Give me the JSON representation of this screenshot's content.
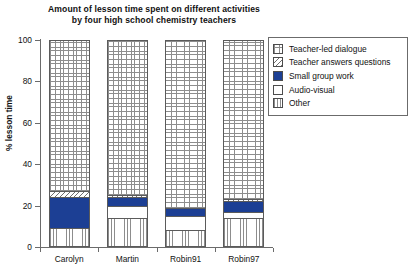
{
  "chart_data": {
    "type": "bar",
    "subtype": "stacked-bar-100",
    "title": "Amount of lesson time spent on different activities by four high school chemistry teachers",
    "title_line1": "Amount of lesson time spent on different activities",
    "title_line2": "by four high school chemistry teachers",
    "xlabel": "",
    "ylabel": "% lesson time",
    "ylim": [
      0,
      100
    ],
    "yticks": [
      0,
      20,
      40,
      60,
      80,
      100
    ],
    "ytick_labels": [
      "0",
      "20",
      "40",
      "60",
      "80",
      "100"
    ],
    "grid": false,
    "legend_position": "right",
    "categories": [
      "Carolyn",
      "Martin",
      "Robin91",
      "Robin97"
    ],
    "series": [
      {
        "name": "Teacher-led dialogue",
        "pattern": "crosshatch-grid",
        "color": "#8d8d8d",
        "values": [
          73,
          75,
          81,
          77
        ]
      },
      {
        "name": "Teacher answers questions",
        "pattern": "diagonal-hatch",
        "color": "#6f6f6f",
        "values": [
          3,
          1,
          0,
          1
        ]
      },
      {
        "name": "Small group work",
        "pattern": "solid",
        "color": "#1c3f94",
        "values": [
          15,
          4,
          4,
          5
        ]
      },
      {
        "name": "Audio-visual",
        "pattern": "white",
        "color": "#ffffff",
        "values": [
          0,
          6,
          7,
          3
        ]
      },
      {
        "name": "Other",
        "pattern": "vertical-lines",
        "color": "#8d8d8d",
        "values": [
          9,
          14,
          8,
          14
        ]
      }
    ],
    "stack_order_bottom_to_top": [
      "Other",
      "Audio-visual",
      "Small group work",
      "Teacher answers questions",
      "Teacher-led dialogue"
    ]
  },
  "legend": {
    "items": [
      {
        "label": "Teacher-led dialogue",
        "pattern": "crosshatch-grid"
      },
      {
        "label": "Teacher answers questions",
        "pattern": "diagonal-hatch"
      },
      {
        "label": "Small group work",
        "pattern": "solid"
      },
      {
        "label": "Audio-visual",
        "pattern": "white"
      },
      {
        "label": "Other",
        "pattern": "vertical-lines"
      }
    ]
  }
}
